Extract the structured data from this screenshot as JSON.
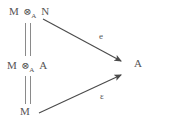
{
  "diagram": {
    "type": "commutative-diagram",
    "background_color": "#ffffff",
    "stroke_color": "#555555",
    "nodes": {
      "top_left": {
        "text": "M ⊗_A N",
        "parts": {
          "left": "M",
          "tensor": "⊗",
          "subscript": "A",
          "right": "N"
        }
      },
      "middle_left": {
        "text": "M ⊗_A A",
        "parts": {
          "left": "M",
          "tensor": "⊗",
          "subscript": "A",
          "right": "A"
        }
      },
      "bottom_left": {
        "text": "M",
        "parts": {
          "left": "M"
        }
      },
      "right": {
        "text": "A",
        "parts": {
          "left": "A"
        }
      }
    },
    "equalities": [
      {
        "name": "top-to-middle",
        "symbol": "="
      },
      {
        "name": "middle-to-bottom",
        "symbol": "="
      }
    ],
    "arrows": [
      {
        "name": "upper-arrow",
        "from": "top_left",
        "to": "right",
        "label": "e"
      },
      {
        "name": "lower-arrow",
        "from": "bottom_left",
        "to": "right",
        "label": "ε"
      }
    ]
  }
}
